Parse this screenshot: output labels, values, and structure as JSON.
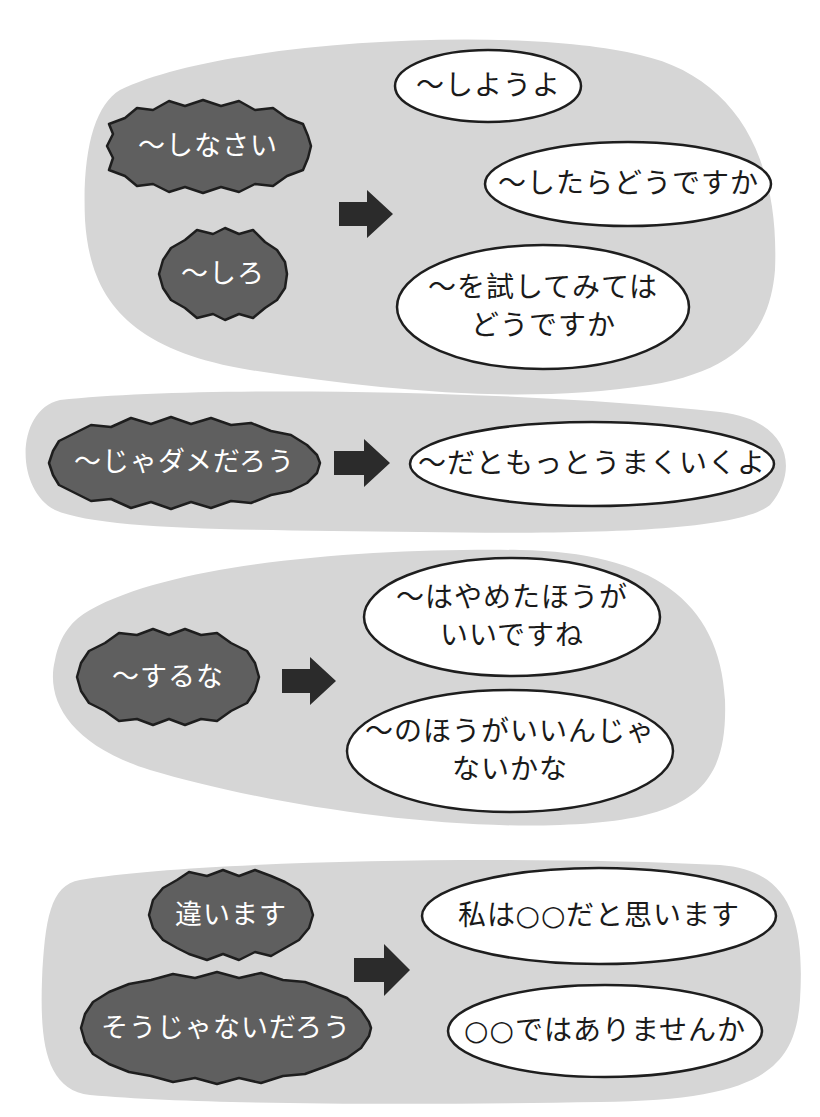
{
  "colors": {
    "panel_gray": "#d6d6d6",
    "bad_fill": "#5f5f5f",
    "outline": "#1e1e1e",
    "good_fill": "#ffffff",
    "arrow": "#2b2b2b"
  },
  "groups": [
    {
      "id": "group-1",
      "negative": [
        {
          "text": "〜しなさい"
        },
        {
          "text": "〜しろ"
        }
      ],
      "arrow": "right-arrow-icon",
      "positive": [
        {
          "text": "〜しようよ"
        },
        {
          "text": "〜したらどうですか"
        },
        {
          "text": "〜を試してみては\nどうですか"
        }
      ]
    },
    {
      "id": "group-2",
      "negative": [
        {
          "text": "〜じゃダメだろう"
        }
      ],
      "arrow": "right-arrow-icon",
      "positive": [
        {
          "text": "〜だともっとうまくいくよ"
        }
      ]
    },
    {
      "id": "group-3",
      "negative": [
        {
          "text": "〜するな"
        }
      ],
      "arrow": "right-arrow-icon",
      "positive": [
        {
          "text": "〜はやめたほうが\nいいですね"
        },
        {
          "text": "〜のほうがいいんじゃ\nないかな"
        }
      ]
    },
    {
      "id": "group-4",
      "negative": [
        {
          "text": "違います"
        },
        {
          "text": "そうじゃないだろう"
        }
      ],
      "arrow": "right-arrow-icon",
      "positive": [
        {
          "text": "私は○○だと思います"
        },
        {
          "text": "○○ではありませんか"
        }
      ]
    }
  ]
}
